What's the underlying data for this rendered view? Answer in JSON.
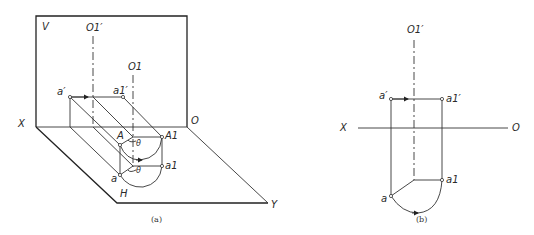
{
  "figure_a": {
    "caption": "(a)",
    "planes": {
      "vertical": "V",
      "horizontal": "H"
    },
    "axes": {
      "x": "X",
      "origin": "O",
      "y": "Y"
    },
    "axis_labels": {
      "o1_prime": "O1′",
      "o1": "O1"
    },
    "points": {
      "a_prime": "a′",
      "a1_prime": "a1′",
      "A": "A",
      "A1": "A1",
      "a": "a",
      "a1": "a1"
    },
    "angle_label": "θ"
  },
  "figure_b": {
    "caption": "(b)",
    "axes": {
      "x": "X",
      "origin": "O"
    },
    "axis_labels": {
      "o1_prime": "O1′"
    },
    "points": {
      "a_prime": "a′",
      "a1_prime": "a1′",
      "a": "a",
      "a1": "a1"
    }
  }
}
